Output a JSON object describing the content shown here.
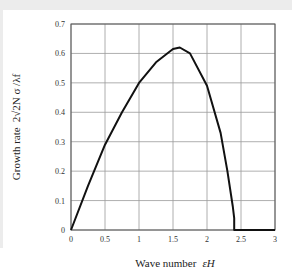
{
  "chart_data": {
    "type": "line",
    "title": "",
    "xlabel": "Wave number",
    "xlabel_symbol": "εH",
    "ylabel": "Growth rate",
    "ylabel_symbol": "2√2N σ /λf",
    "xlim": [
      0,
      3
    ],
    "ylim": [
      0,
      0.7
    ],
    "grid": true,
    "legend": null,
    "x_ticks": [
      "0",
      "0.5",
      "1",
      "1.5",
      "2",
      "2.5",
      "3"
    ],
    "y_ticks": [
      "0",
      "0.1",
      "0.2",
      "0.3",
      "0.4",
      "0.5",
      "0.6",
      "0.7"
    ],
    "series": [
      {
        "name": "growth rate",
        "x": [
          0,
          0.25,
          0.5,
          0.75,
          1.0,
          1.25,
          1.5,
          1.6,
          1.75,
          2.0,
          2.2,
          2.3,
          2.38,
          2.4,
          2.4,
          3.0
        ],
        "y": [
          0,
          0.15,
          0.29,
          0.4,
          0.5,
          0.57,
          0.615,
          0.62,
          0.6,
          0.49,
          0.33,
          0.2,
          0.08,
          0.04,
          0,
          0
        ]
      }
    ],
    "colors": {
      "line": "#111111",
      "grid": "#9a9a9a",
      "axis": "#555555"
    }
  }
}
